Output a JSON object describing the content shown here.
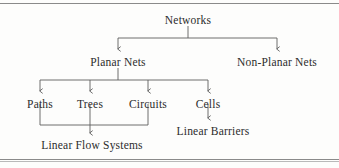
{
  "figure": {
    "type": "hierarchy-tree",
    "line_color": "#5e5e5e",
    "text_color": "#2c2c2c",
    "background_color": "#fdfdfc"
  },
  "rules": {
    "top_label": "top-horizontal-rule",
    "bottom_label": "bottom-horizontal-rule"
  },
  "nodes": {
    "root": {
      "label": "Networks",
      "x": 188,
      "y": 14,
      "level": 0
    },
    "planar": {
      "label": "Planar Nets",
      "x": 118,
      "y": 56,
      "level": 1
    },
    "nonplanar": {
      "label": "Non-Planar Nets",
      "x": 277,
      "y": 56,
      "level": 1
    },
    "paths": {
      "label": "Paths",
      "x": 40,
      "y": 98,
      "level": 2
    },
    "trees": {
      "label": "Trees",
      "x": 90,
      "y": 98,
      "level": 2
    },
    "circuits": {
      "label": "Circuits",
      "x": 148,
      "y": 98,
      "level": 2
    },
    "cells": {
      "label": "Cells",
      "x": 208,
      "y": 98,
      "level": 2
    },
    "linear_flow": {
      "label": "Linear Flow Systems",
      "x": 92,
      "y": 139,
      "level": 3
    },
    "linear_barriers": {
      "label": "Linear Barriers",
      "x": 213,
      "y": 125,
      "level": 3
    }
  },
  "edges": [
    {
      "name": "networks-to-planar",
      "from": "Networks",
      "to": "Planar Nets",
      "arrow": true
    },
    {
      "name": "networks-to-nonplanar",
      "from": "Networks",
      "to": "Non-Planar Nets",
      "arrow": true
    },
    {
      "name": "planar-to-paths",
      "from": "Planar Nets",
      "to": "Paths",
      "arrow": true
    },
    {
      "name": "planar-to-trees",
      "from": "Planar Nets",
      "to": "Trees",
      "arrow": true
    },
    {
      "name": "planar-to-circuits",
      "from": "Planar Nets",
      "to": "Circuits",
      "arrow": true
    },
    {
      "name": "planar-to-cells",
      "from": "Planar Nets",
      "to": "Cells",
      "arrow": true
    },
    {
      "name": "paths-trees-circuits-to-linear-flow",
      "from": "Paths, Trees, Circuits",
      "to": "Linear Flow Systems",
      "arrow": true
    },
    {
      "name": "cells-to-linear-barriers",
      "from": "Cells",
      "to": "Linear Barriers",
      "arrow": true
    }
  ]
}
